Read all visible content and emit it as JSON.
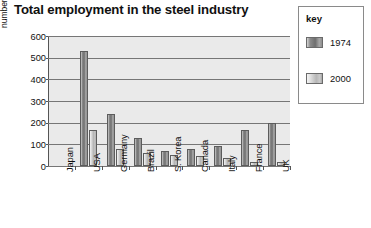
{
  "chart_data": {
    "type": "bar",
    "title": "Total employment in the steel industry",
    "xlabel": "",
    "ylabel": "number employed (thousands)",
    "ylim": [
      0,
      600
    ],
    "ytick_step": 100,
    "yticks": [
      "0",
      "100",
      "200",
      "300",
      "400",
      "500",
      "600"
    ],
    "grid": true,
    "legend_position": "right-outside",
    "legend_title": "key",
    "categories": [
      "Japan",
      "USA",
      "Germany",
      "Brazil",
      "S. Korea",
      "Canada",
      "Italy",
      "France",
      "UK"
    ],
    "series": [
      {
        "name": "1974",
        "values": [
          null,
          530,
          238,
          130,
          68,
          77,
          94,
          165,
          197
        ]
      },
      {
        "name": "2000",
        "values": [
          null,
          165,
          78,
          62,
          52,
          45,
          37,
          20,
          18
        ]
      }
    ]
  },
  "colors": {
    "plot_background": "#eaeaea",
    "gridline": "#767676",
    "axis": "#555555",
    "series_1974": "#6f6f6f",
    "series_2000": "#c3c3c3",
    "text": "#111111",
    "legend_border": "#8a8a8a"
  }
}
